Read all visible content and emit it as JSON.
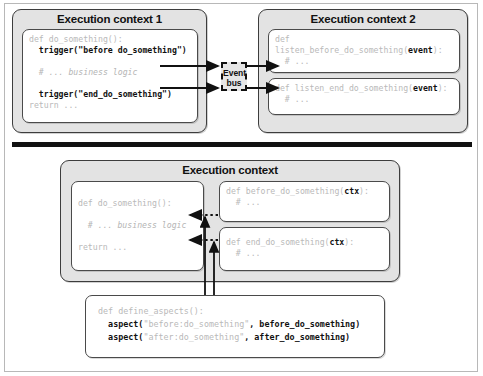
{
  "diagram": {
    "divider": "horizontal-rule"
  },
  "colors": {
    "panel_fill": "#e3e3e3",
    "panel_border": "#3d3d3d",
    "code_fill": "#ffffff",
    "code_border": "#4a4a4a",
    "code_dim_text": "#b9b9b9",
    "code_bold_text": "#111111",
    "divider": "#111111",
    "frame": "#b8b8b8"
  },
  "top": {
    "left_panel": {
      "title": "Execution context 1",
      "code": {
        "lines": [
          [
            {
              "t": "def do_something():",
              "s": "dim"
            }
          ],
          [
            {
              "t": "  trigger(",
              "s": "bold"
            },
            {
              "t": "\"before do_something\"",
              "s": "bold"
            },
            {
              "t": ")",
              "s": "bold"
            }
          ],
          [
            {
              "t": "",
              "s": "dim"
            }
          ],
          [
            {
              "t": "  # ... business logic",
              "s": "italic"
            }
          ],
          [
            {
              "t": "",
              "s": "dim"
            }
          ],
          [
            {
              "t": "  trigger(",
              "s": "bold"
            },
            {
              "t": "\"end_do_something\"",
              "s": "bold"
            },
            {
              "t": ")",
              "s": "bold"
            }
          ],
          [
            {
              "t": "return ...",
              "s": "dim"
            }
          ]
        ]
      }
    },
    "event_bus": {
      "label_line1": "Event",
      "label_line2": "bus"
    },
    "right_panel": {
      "title": "Execution context 2",
      "code_blocks": [
        {
          "lines": [
            [
              {
                "t": "def",
                "s": "dim"
              }
            ],
            [
              {
                "t": "listen_before_do_something(",
                "s": "dim"
              },
              {
                "t": "event",
                "s": "bold"
              },
              {
                "t": "):",
                "s": "dim"
              }
            ],
            [
              {
                "t": "  # ...",
                "s": "dim"
              }
            ]
          ]
        },
        {
          "lines": [
            [
              {
                "t": "def listen_end_do_something(",
                "s": "dim"
              },
              {
                "t": "event",
                "s": "bold"
              },
              {
                "t": "):",
                "s": "dim"
              }
            ],
            [
              {
                "t": "  # ...",
                "s": "dim"
              }
            ]
          ]
        }
      ]
    }
  },
  "bottom": {
    "panel": {
      "title": "Execution context",
      "main_code": {
        "lines": [
          [
            {
              "t": "def do_something():",
              "s": "dim"
            }
          ],
          [
            {
              "t": "",
              "s": "dim"
            }
          ],
          [
            {
              "t": "  # ... business logic",
              "s": "italic"
            }
          ],
          [
            {
              "t": "",
              "s": "dim"
            }
          ],
          [
            {
              "t": "return ...",
              "s": "dim"
            }
          ]
        ]
      },
      "advice_blocks": [
        {
          "lines": [
            [
              {
                "t": "def before_do_something(",
                "s": "dim"
              },
              {
                "t": "ctx",
                "s": "bold"
              },
              {
                "t": "):",
                "s": "dim"
              }
            ],
            [
              {
                "t": "  # ...",
                "s": "dim"
              }
            ]
          ]
        },
        {
          "lines": [
            [
              {
                "t": "def end_do_something(",
                "s": "dim"
              },
              {
                "t": "ctx",
                "s": "bold"
              },
              {
                "t": "):",
                "s": "dim"
              }
            ],
            [
              {
                "t": "  # ...",
                "s": "dim"
              }
            ]
          ]
        }
      ]
    },
    "aspects_code": {
      "lines": [
        [
          {
            "t": "def define_aspects():",
            "s": "dim"
          }
        ],
        [
          {
            "t": "  aspect(",
            "s": "bold"
          },
          {
            "t": "\"before:do_something\"",
            "s": "dim"
          },
          {
            "t": ", before_do_something)",
            "s": "bold"
          }
        ],
        [
          {
            "t": "  aspect(",
            "s": "bold"
          },
          {
            "t": "\"after:do_something\"",
            "s": "dim"
          },
          {
            "t": ", after_do_something)",
            "s": "bold"
          }
        ]
      ]
    }
  }
}
